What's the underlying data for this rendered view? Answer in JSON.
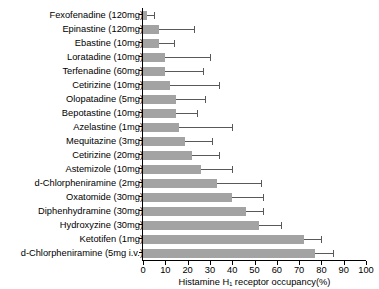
{
  "caption_fragment": "",
  "chart_data": {
    "type": "bar",
    "orientation": "horizontal",
    "title": "",
    "xlabel": "Histamine H₁ receptor occupancy(%)",
    "ylabel": "",
    "xlim": [
      0,
      100
    ],
    "xticks": [
      0,
      10,
      20,
      30,
      40,
      50,
      60,
      70,
      80,
      90,
      100
    ],
    "xticklabels": [
      "0",
      "10",
      "20",
      "30",
      "40",
      "50",
      "60",
      "70",
      "80",
      "90",
      "100"
    ],
    "grid": false,
    "legend": null,
    "bar_color": "#a3a3a3",
    "errorbar_color": "#595959",
    "categories": [
      "Fexofenadine (120mg)",
      "Epinastine (120mg)",
      "Ebastine (10mg)",
      "Loratadine (10mg)",
      "Terfenadine (60mg)",
      "Cetirizine (10mg)",
      "Olopatadine (5mg)",
      "Bepotastine (10mg)",
      "Azelastine (1mg)",
      "Mequitazine (3mg)",
      "Cetirizine (20mg)",
      "Astemizole (10mg)",
      "d-Chlorpheniramine (2mg)",
      "Oxatomide (30mg)",
      "Diphenhydramine (30mg)",
      "Hydroxyzine (30mg)",
      "Ketotifen (1mg)",
      "d-Chlorpheniramine (5mg i.v.)"
    ],
    "values": [
      2,
      7,
      7,
      10,
      10,
      12,
      15,
      15,
      16,
      19,
      22,
      26,
      33,
      40,
      46,
      52,
      72,
      77
    ],
    "errors": [
      3,
      16,
      7,
      20,
      17,
      22,
      13,
      9,
      24,
      12,
      12,
      14,
      20,
      14,
      8,
      10,
      8,
      8
    ],
    "value_unit": "%"
  }
}
